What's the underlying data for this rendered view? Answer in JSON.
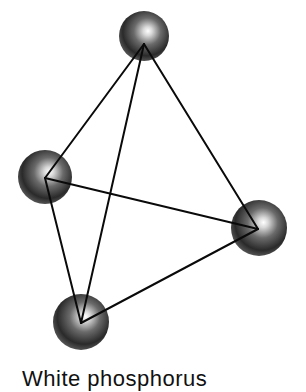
{
  "diagram": {
    "caption": "White phosphorus",
    "atoms": [
      {
        "id": "top",
        "cx": 144,
        "cy": 36,
        "r": 25,
        "vx": 144,
        "vy": 44
      },
      {
        "id": "left",
        "cx": 45,
        "cy": 177,
        "r": 27,
        "vx": 45,
        "vy": 178
      },
      {
        "id": "right",
        "cx": 259,
        "cy": 228,
        "r": 28,
        "vx": 258,
        "vy": 229
      },
      {
        "id": "bottom",
        "cx": 81,
        "cy": 322,
        "r": 28,
        "vx": 81,
        "vy": 323
      }
    ],
    "bonds": [
      [
        "top",
        "left"
      ],
      [
        "top",
        "right"
      ],
      [
        "top",
        "bottom"
      ],
      [
        "left",
        "right"
      ],
      [
        "left",
        "bottom"
      ],
      [
        "bottom",
        "right"
      ]
    ],
    "colors": {
      "atom_dark": "#1a1a1a",
      "atom_mid": "#555555",
      "atom_highlight": "#ffffff",
      "bond": "#0a0a0a",
      "background": "#ffffff"
    }
  }
}
